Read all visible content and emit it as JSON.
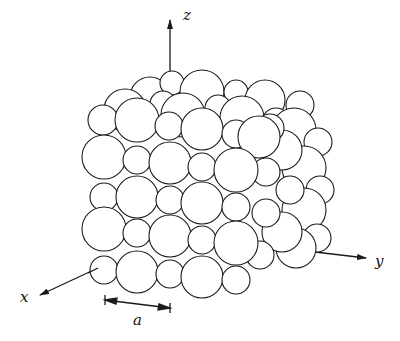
{
  "figure": {
    "axes": {
      "x_label": "x",
      "y_label": "y",
      "z_label": "z"
    },
    "scale_bar_label": "a",
    "colors": {
      "stroke": "#1a1a1a",
      "fill": "#ffffff"
    }
  }
}
